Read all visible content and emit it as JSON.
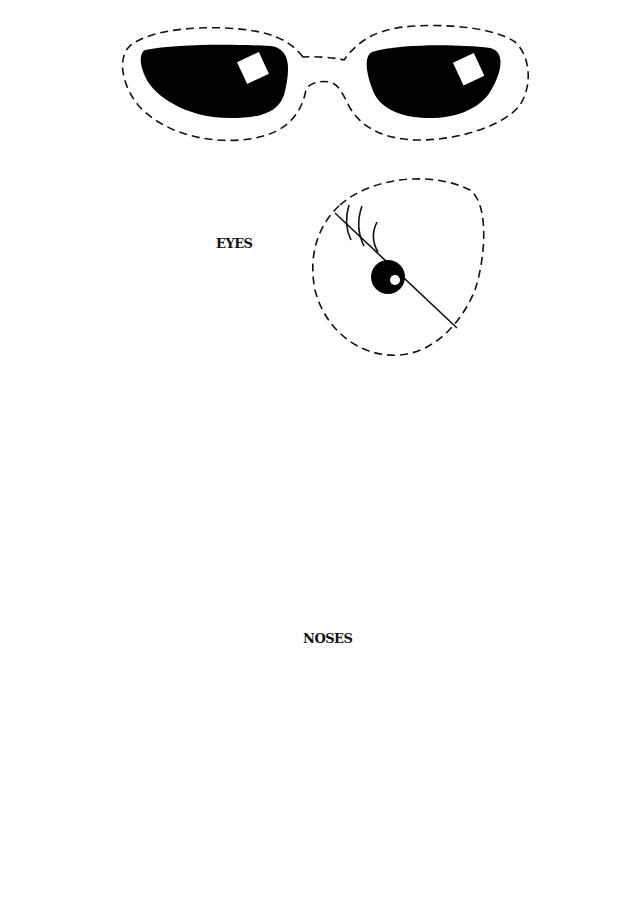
{
  "sections": {
    "eyes": {
      "label": "EYES"
    },
    "noses": {
      "label": "NOSES"
    }
  },
  "pieces": {
    "sunglasses": {
      "name": "sunglasses",
      "lenses": 2
    },
    "eyes": [
      {
        "name": "winking-eye-left-lashes"
      },
      {
        "name": "googly-eyes-pair"
      },
      {
        "name": "winking-eye-right-lashes"
      }
    ],
    "noses": [
      {
        "name": "bulb-nose-with-nostrils"
      },
      {
        "name": "round-drop-nose"
      },
      {
        "name": "triangle-nose"
      }
    ]
  },
  "colors": {
    "ink": "#111111",
    "background": "#ffffff"
  }
}
